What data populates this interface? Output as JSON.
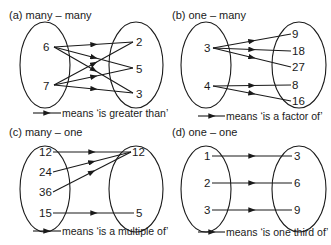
{
  "panels": [
    {
      "id": "a",
      "title": "(a) many – many",
      "left": [
        "6",
        "7"
      ],
      "right": [
        "2",
        "5",
        "3"
      ],
      "legend": "means ‘is greater than’",
      "mappings": [
        [
          "6",
          "2"
        ],
        [
          "6",
          "5"
        ],
        [
          "6",
          "3"
        ],
        [
          "7",
          "2"
        ],
        [
          "7",
          "5"
        ],
        [
          "7",
          "3"
        ]
      ]
    },
    {
      "id": "b",
      "title": "(b) one – many",
      "left": [
        "3",
        "4"
      ],
      "right": [
        "9",
        "18",
        "27",
        "8",
        "16"
      ],
      "legend": "means ‘is a factor of’",
      "mappings": [
        [
          "3",
          "9"
        ],
        [
          "3",
          "18"
        ],
        [
          "3",
          "27"
        ],
        [
          "4",
          "8"
        ],
        [
          "4",
          "16"
        ]
      ]
    },
    {
      "id": "c",
      "title": "(c) many – one",
      "left": [
        "12",
        "24",
        "36",
        "15"
      ],
      "right": [
        "12",
        "5"
      ],
      "legend": "means ‘is a multiple of’",
      "mappings": [
        [
          "12",
          "12"
        ],
        [
          "24",
          "12"
        ],
        [
          "36",
          "12"
        ],
        [
          "15",
          "5"
        ]
      ]
    },
    {
      "id": "d",
      "title": "(d) one – one",
      "left": [
        "1",
        "2",
        "3"
      ],
      "right": [
        "3",
        "6",
        "9"
      ],
      "legend": "means ‘is one third of’",
      "mappings": [
        [
          "1",
          "3"
        ],
        [
          "2",
          "6"
        ],
        [
          "3",
          "9"
        ]
      ]
    }
  ]
}
